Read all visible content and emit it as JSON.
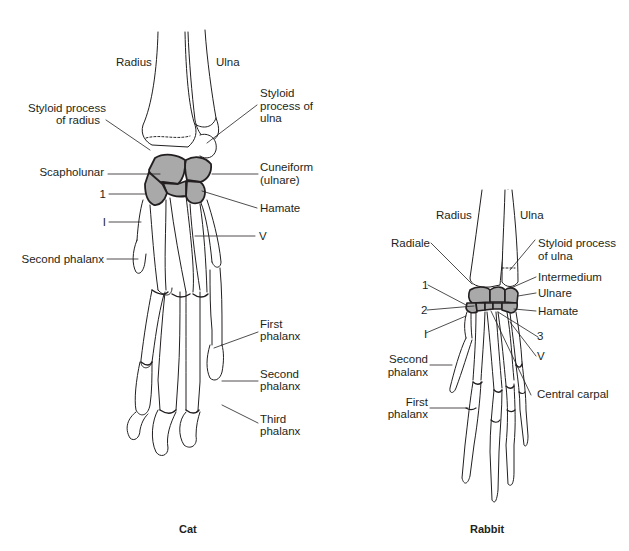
{
  "figure": {
    "colors": {
      "bone_outline": "#231f20",
      "carpal_fill": "#a9a9a9",
      "background": "#ffffff"
    },
    "panels": [
      {
        "id": "cat",
        "caption": "Cat",
        "labels": {
          "radius": "Radius",
          "ulna": "Ulna",
          "styloid_radius_1": "Styloid process",
          "styloid_radius_2": "of radius",
          "styloid_ulna_1": "Styloid",
          "styloid_ulna_2": "process of",
          "styloid_ulna_3": "ulna",
          "scapholunar": "Scapholunar",
          "cuneiform_1": "Cuneiform",
          "cuneiform_2": "(ulnare)",
          "carpal_1": "1",
          "hamate": "Hamate",
          "digit_i": "I",
          "digit_v": "V",
          "second_phalanx_left": "Second phalanx",
          "first_phalanx_1": "First",
          "first_phalanx_2": "phalanx",
          "second_phalanx_1": "Second",
          "second_phalanx_2": "phalanx",
          "third_phalanx_1": "Third",
          "third_phalanx_2": "phalanx"
        }
      },
      {
        "id": "rabbit",
        "caption": "Rabbit",
        "labels": {
          "radius": "Radius",
          "ulna": "Ulna",
          "radiale": "Radiale",
          "styloid_ulna_1": "Styloid process",
          "styloid_ulna_2": "of ulna",
          "carpal_1": "1",
          "intermedium": "Intermedium",
          "ulnare": "Ulnare",
          "carpal_2": "2",
          "hamate": "Hamate",
          "digit_i": "I",
          "carpal_3": "3",
          "digit_v": "V",
          "second_phalanx_1": "Second",
          "second_phalanx_2": "phalanx",
          "central_carpal": "Central carpal",
          "first_phalanx_1": "First",
          "first_phalanx_2": "phalanx"
        }
      }
    ]
  }
}
